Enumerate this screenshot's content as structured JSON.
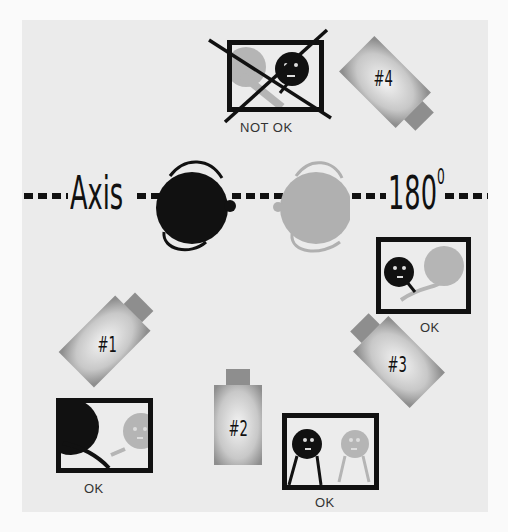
{
  "diagram": {
    "axis": {
      "left_label": "Axis",
      "right_label": "180",
      "degree_symbol": "0"
    },
    "cameras": [
      {
        "id": "1",
        "label": "#1"
      },
      {
        "id": "2",
        "label": "#2"
      },
      {
        "id": "3",
        "label": "#3"
      },
      {
        "id": "4",
        "label": "#4"
      }
    ],
    "frames": [
      {
        "camera": "#4",
        "caption": "NOT  OK",
        "crossed_out": true
      },
      {
        "camera": "#3",
        "caption": "OK",
        "crossed_out": false
      },
      {
        "camera": "#1",
        "caption": "OK",
        "crossed_out": false
      },
      {
        "camera": "#2",
        "caption": "OK",
        "crossed_out": false
      }
    ],
    "subjects": [
      {
        "name": "dark-subject",
        "color": "#111111"
      },
      {
        "name": "light-subject",
        "color": "#b0b0b0"
      }
    ],
    "colors": {
      "background": "#ebebeb",
      "ink": "#111111",
      "light_subject": "#b0b0b0"
    }
  }
}
